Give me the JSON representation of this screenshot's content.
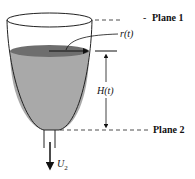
{
  "diagram": {
    "labels": {
      "plane1": "Plane 1",
      "plane1_dash": "-",
      "plane2": "Plane 2",
      "radius": "r(t)",
      "height": "H(t)",
      "velocity_main": "U",
      "velocity_sub": "2"
    },
    "colors": {
      "liquid": "#a9a9a9",
      "liquid_surface": "#707070",
      "outline": "#222222",
      "background": "#ffffff"
    }
  }
}
